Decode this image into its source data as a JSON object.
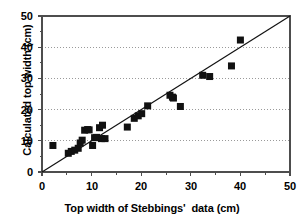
{
  "chart_data": {
    "type": "scatter",
    "title": "",
    "xlabel": "Top width of Stebbings'  data (cm)",
    "ylabel": "Calculated top width (cm)",
    "xlim": [
      0,
      50
    ],
    "ylim": [
      0,
      50
    ],
    "xticks": [
      0,
      10,
      20,
      30,
      40,
      50
    ],
    "yticks": [
      0,
      10,
      20,
      30,
      40,
      50
    ],
    "xtick_labels": [
      "0",
      "10",
      "20",
      "30",
      "40",
      "50"
    ],
    "ytick_labels": [
      "0",
      "10",
      "20",
      "30",
      "40",
      "50"
    ],
    "grid": "horizontal-dotted",
    "legend": "none",
    "marker": {
      "shape": "square",
      "color": "#111111",
      "size_px": 7
    },
    "reference_line": {
      "name": "one-to-one-line",
      "type": "line",
      "from": [
        0,
        0
      ],
      "to": [
        50,
        50
      ],
      "color": "#111111",
      "width_px": 1.2
    },
    "points": [
      {
        "x": 2.2,
        "y": 8.5
      },
      {
        "x": 5.3,
        "y": 6.0
      },
      {
        "x": 5.9,
        "y": 6.6
      },
      {
        "x": 6.6,
        "y": 7.0
      },
      {
        "x": 7.3,
        "y": 7.6
      },
      {
        "x": 7.7,
        "y": 9.3
      },
      {
        "x": 8.1,
        "y": 10.2
      },
      {
        "x": 8.6,
        "y": 13.4
      },
      {
        "x": 9.2,
        "y": 13.6
      },
      {
        "x": 9.5,
        "y": 13.5
      },
      {
        "x": 10.2,
        "y": 8.5
      },
      {
        "x": 10.6,
        "y": 11.0
      },
      {
        "x": 11.0,
        "y": 11.1
      },
      {
        "x": 11.6,
        "y": 14.2
      },
      {
        "x": 12.2,
        "y": 15.0
      },
      {
        "x": 12.0,
        "y": 10.7
      },
      {
        "x": 12.7,
        "y": 10.7
      },
      {
        "x": 17.2,
        "y": 14.4
      },
      {
        "x": 18.6,
        "y": 17.2
      },
      {
        "x": 19.4,
        "y": 18.0
      },
      {
        "x": 20.1,
        "y": 18.7
      },
      {
        "x": 21.3,
        "y": 21.2
      },
      {
        "x": 25.8,
        "y": 24.6
      },
      {
        "x": 26.3,
        "y": 24.0
      },
      {
        "x": 26.5,
        "y": 23.7
      },
      {
        "x": 27.9,
        "y": 21.0
      },
      {
        "x": 32.4,
        "y": 31.0
      },
      {
        "x": 33.8,
        "y": 30.6
      },
      {
        "x": 38.2,
        "y": 34.0
      },
      {
        "x": 40.0,
        "y": 42.3
      }
    ]
  },
  "axes": {
    "frame_color": "#4d4d4d",
    "grid_color": "#9a9a9a",
    "background": "#ffffff"
  }
}
